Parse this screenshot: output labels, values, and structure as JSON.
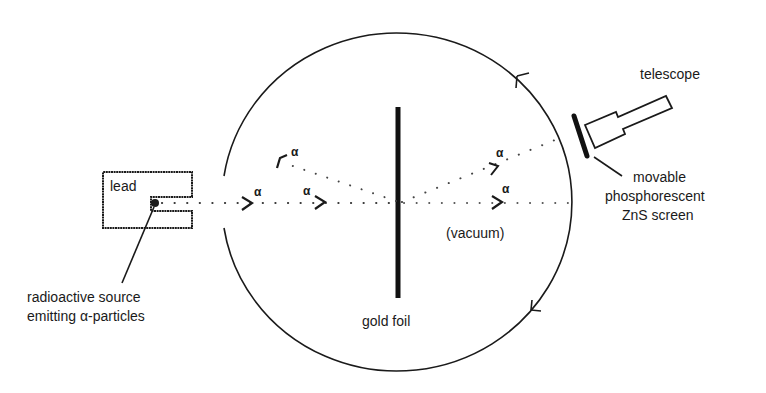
{
  "diagram": {
    "labels": {
      "lead": "lead",
      "source_line1": "radioactive source",
      "source_line2": "emitting α-particles",
      "gold_foil": "gold foil",
      "vacuum": "(vacuum)",
      "telescope": "telescope",
      "screen_line1": "movable",
      "screen_line2": "phosphorescent",
      "screen_line3": "ZnS screen"
    },
    "particle_symbol": "α",
    "beams": [
      {
        "name": "incident-beam",
        "alpha_labels": 2
      },
      {
        "name": "back-scattered-beam",
        "alpha_labels": 1
      },
      {
        "name": "undeflected-beam",
        "alpha_labels": 1
      },
      {
        "name": "deflected-beam",
        "alpha_labels": 1
      }
    ],
    "colors": {
      "ink": "#1a1a1a",
      "background": "#ffffff"
    }
  }
}
